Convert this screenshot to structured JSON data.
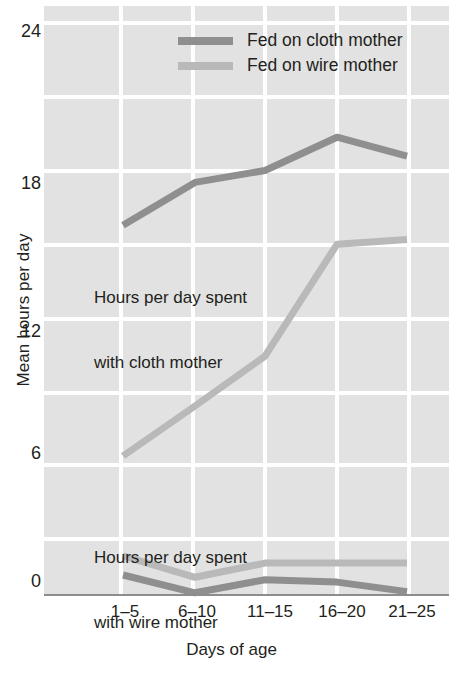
{
  "chart_data": {
    "type": "line",
    "title": "",
    "xlabel": "Days of age",
    "ylabel": "Mean hours per day",
    "categories": [
      "1–5",
      "6–10",
      "11–15",
      "16–20",
      "21–25"
    ],
    "ylim": [
      0,
      24
    ],
    "yticks": [
      0,
      6,
      12,
      18,
      24
    ],
    "ytick_labels": [
      "0",
      "6",
      "12",
      "18",
      "24"
    ],
    "grid": true,
    "legend_position": "top-center",
    "legend": [
      {
        "label": "Fed on cloth mother",
        "color": "#8f8f8f"
      },
      {
        "label": "Fed on wire mother",
        "color": "#b9b9b9"
      }
    ],
    "annotations": [
      {
        "text": "Hours per day spent\nwith cloth mother",
        "x_category": "1–5",
        "y": 10.5
      },
      {
        "text": "Hours per day spent\nwith wire mother",
        "x_category": "1–5",
        "y": 4.0
      }
    ],
    "series": [
      {
        "name": "Fed on cloth mother",
        "measure": "Hours per day spent with cloth mother",
        "color": "#8f8f8f",
        "values": [
          15.5,
          17.3,
          17.8,
          19.2,
          18.4
        ]
      },
      {
        "name": "Fed on wire mother",
        "measure": "Hours per day spent with cloth mother",
        "color": "#b9b9b9",
        "values": [
          5.8,
          7.9,
          10.0,
          14.7,
          14.9
        ]
      },
      {
        "name": "Fed on wire mother",
        "measure": "Hours per day spent with wire mother",
        "color": "#b9b9b9",
        "values": [
          1.6,
          0.7,
          1.3,
          1.3,
          1.3
        ]
      },
      {
        "name": "Fed on cloth mother",
        "measure": "Hours per day spent with wire mother",
        "color": "#8f8f8f",
        "values": [
          0.8,
          0.05,
          0.6,
          0.5,
          0.1
        ]
      }
    ]
  },
  "axes": {
    "y_title": "Mean hours per day",
    "x_title": "Days of age",
    "y_ticks": [
      "24",
      "18",
      "12",
      "6",
      "0"
    ],
    "x_ticks": [
      "1–5",
      "6–10",
      "11–15",
      "16–20",
      "21–25"
    ]
  },
  "legend": {
    "item1": "Fed on cloth mother",
    "item2": "Fed on wire mother"
  },
  "annotations": {
    "cloth_line1": "Hours per day spent",
    "cloth_line2": "with cloth mother",
    "wire_line1": "Hours per day spent",
    "wire_line2": "with wire mother"
  },
  "colors": {
    "panel": "#e2e2e2",
    "grid": "#ffffff",
    "cloth": "#8f8f8f",
    "wire": "#b9b9b9",
    "axis": "#8d8d8d",
    "text": "#231f20"
  }
}
